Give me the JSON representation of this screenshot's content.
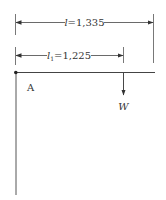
{
  "diagram": {
    "type": "cantilever-beam",
    "colors": {
      "line": "#444444",
      "text": "#333333",
      "background": "#ffffff"
    },
    "dimensions": [
      {
        "id": "l",
        "symbol": "l",
        "subscript": "",
        "label_full": "l=1,335",
        "value": "1,335"
      },
      {
        "id": "l1",
        "symbol": "l",
        "subscript": "1",
        "label_full": "l1=1,225",
        "value": "1,225"
      }
    ],
    "point_label": "A",
    "load": {
      "symbol": "W",
      "direction": "down"
    }
  }
}
